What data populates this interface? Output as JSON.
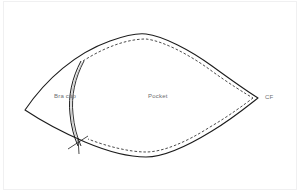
{
  "diagram": {
    "background_color": "#ffffff",
    "outline_color": "#1c1c1c",
    "stitch_line_color": "#2a2a2a",
    "label_color": "#6d6d70",
    "frame_color": "#f0f0f1"
  },
  "labels": {
    "bra_cup": "Bra cup",
    "pocket": "Pocket",
    "center_front": "CF"
  },
  "icons": {
    "notch": "notch-mark-icon",
    "seam": "double-seam-line-icon",
    "stitch": "dashed-stitch-line-icon"
  },
  "geometry": {
    "left_point": [
      25,
      110
    ],
    "top_apex": [
      146,
      34
    ],
    "right_point": [
      258,
      98
    ],
    "bottom_low": [
      150,
      157
    ],
    "seam_top": [
      81,
      61
    ],
    "seam_bottom": [
      78,
      145
    ],
    "notch_point": [
      78,
      143
    ]
  }
}
